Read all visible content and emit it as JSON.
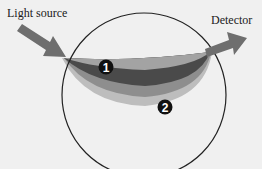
{
  "labels": {
    "light_source": "Light source",
    "detector": "Detector"
  },
  "markers": [
    {
      "id": "1",
      "label": "1",
      "cx": 106,
      "cy": 67
    },
    {
      "id": "2",
      "label": "2",
      "cx": 165,
      "cy": 107
    }
  ],
  "colors": {
    "background": "#f0f0f0",
    "circle_stroke": "#222222",
    "arrow": "#6e6e6e",
    "layer_outer": "#b9b9b9",
    "layer_mid": "#8a8a8a",
    "layer_inner": "#474747",
    "layer_top": "#a8a8a8",
    "marker_fill": "#111111",
    "marker_text": "#ffffff"
  }
}
